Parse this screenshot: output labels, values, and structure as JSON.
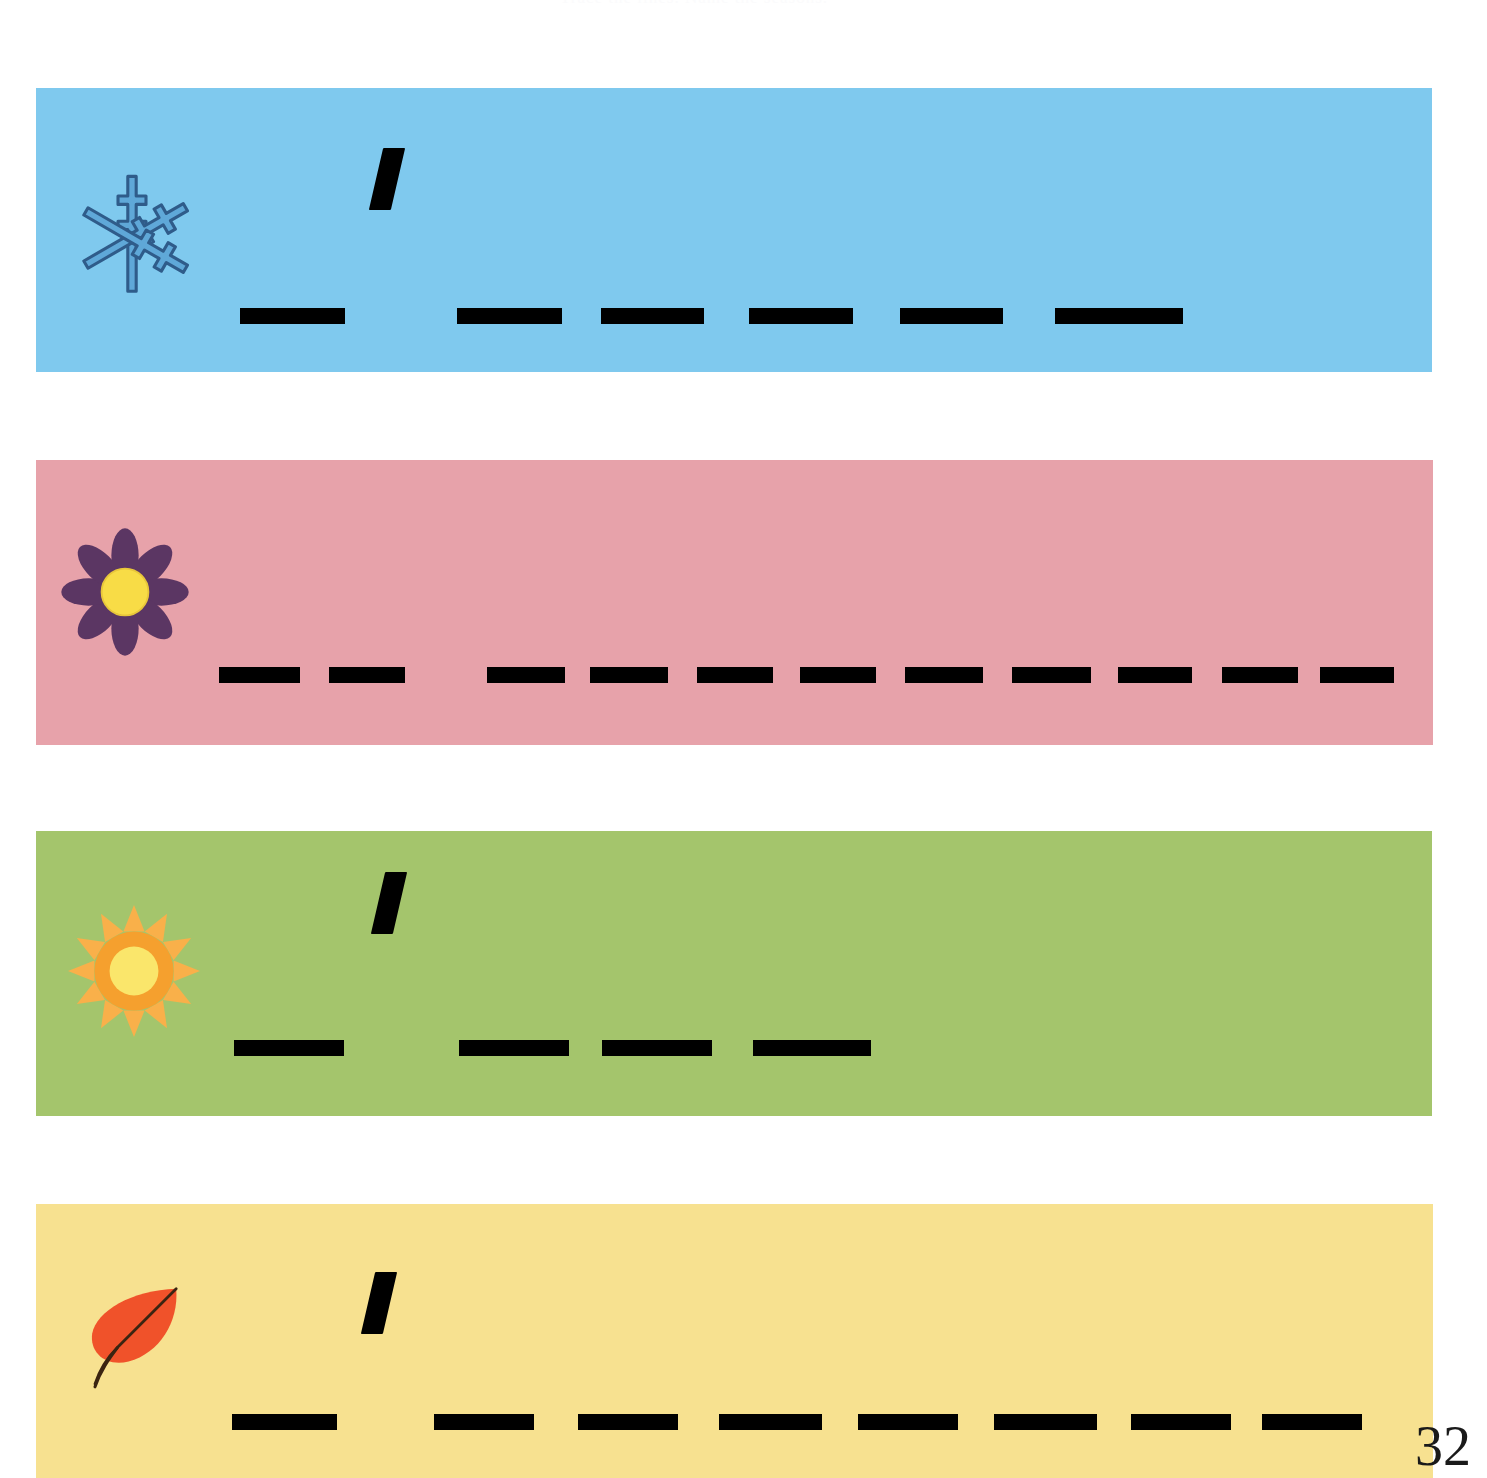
{
  "worksheet": {
    "header_text": "Trace the lines. Name the seasons.",
    "page_number": "32",
    "background_color": "#ffffff"
  },
  "bands": [
    {
      "id": "winter",
      "icon": "snowflake-icon",
      "icon_label": "snowflake",
      "background_color": "#7FC9EE",
      "icon_color": "#5FA8D8",
      "icon_outline_color": "#2F5C8A",
      "x": 36,
      "y": 88,
      "width": 1396,
      "height": 284,
      "tick": {
        "x": 376,
        "y": 148,
        "present": true
      },
      "line": {
        "y": 308,
        "dash_color": "#000000",
        "dashes": [
          {
            "x": 240,
            "width": 105
          },
          {
            "x": 457,
            "width": 105
          },
          {
            "x": 601,
            "width": 103
          },
          {
            "x": 749,
            "width": 104
          },
          {
            "x": 900,
            "width": 103
          },
          {
            "x": 1055,
            "width": 128
          }
        ]
      }
    },
    {
      "id": "spring",
      "icon": "flower-icon",
      "icon_label": "flower",
      "background_color": "#E7A2AA",
      "icon_color": "#5B3663",
      "icon_center_color": "#F8DC46",
      "x": 36,
      "y": 460,
      "width": 1397,
      "height": 285,
      "tick": {
        "x": 0,
        "y": 0,
        "present": false
      },
      "line": {
        "y": 667,
        "dash_color": "#000000",
        "dashes": [
          {
            "x": 219,
            "width": 81
          },
          {
            "x": 329,
            "width": 76
          },
          {
            "x": 487,
            "width": 78
          },
          {
            "x": 590,
            "width": 78
          },
          {
            "x": 697,
            "width": 76
          },
          {
            "x": 800,
            "width": 76
          },
          {
            "x": 905,
            "width": 78
          },
          {
            "x": 1012,
            "width": 79
          },
          {
            "x": 1118,
            "width": 74
          },
          {
            "x": 1222,
            "width": 76
          },
          {
            "x": 1320,
            "width": 74
          }
        ]
      }
    },
    {
      "id": "summer",
      "icon": "sun-icon",
      "icon_label": "sun",
      "background_color": "#A4C56C",
      "icon_color": "#F5A02E",
      "icon_ray_color": "#F9B04A",
      "icon_center_color": "#FAE66B",
      "x": 36,
      "y": 831,
      "width": 1396,
      "height": 285,
      "tick": {
        "x": 378,
        "y": 872,
        "present": true
      },
      "line": {
        "y": 1040,
        "dash_color": "#000000",
        "dashes": [
          {
            "x": 234,
            "width": 110
          },
          {
            "x": 459,
            "width": 110
          },
          {
            "x": 602,
            "width": 110
          },
          {
            "x": 753,
            "width": 118
          }
        ]
      }
    },
    {
      "id": "autumn",
      "icon": "leaf-icon",
      "icon_label": "leaf",
      "background_color": "#F7E190",
      "icon_color": "#F0522A",
      "icon_stem_color": "#3B2411",
      "x": 36,
      "y": 1204,
      "width": 1397,
      "height": 274,
      "tick": {
        "x": 368,
        "y": 1272,
        "present": true
      },
      "line": {
        "y": 1414,
        "dash_color": "#000000",
        "dashes": [
          {
            "x": 232,
            "width": 105
          },
          {
            "x": 434,
            "width": 100
          },
          {
            "x": 578,
            "width": 100
          },
          {
            "x": 719,
            "width": 103
          },
          {
            "x": 858,
            "width": 100
          },
          {
            "x": 994,
            "width": 103
          },
          {
            "x": 1131,
            "width": 100
          },
          {
            "x": 1262,
            "width": 100
          }
        ]
      }
    }
  ]
}
